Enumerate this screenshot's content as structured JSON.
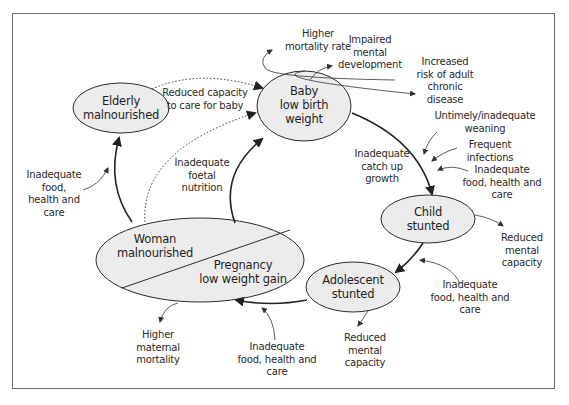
{
  "diagram": {
    "type": "cycle",
    "nodes": {
      "elderly": {
        "line1": "Elderly",
        "line2": "malnourished"
      },
      "baby": {
        "line1": "Baby",
        "line2": "low birth",
        "line3": "weight"
      },
      "child": {
        "line1": "Child",
        "line2": "stunted"
      },
      "adolescent": {
        "line1": "Adolescent",
        "line2": "stunted"
      },
      "woman": {
        "line1": "Woman",
        "line2": "malnourished"
      },
      "pregnancy": {
        "line1": "Pregnancy",
        "line2": "low weight gain"
      }
    },
    "labels": {
      "reduced_capacity": {
        "line1": "Reduced capacity",
        "line2": "to care for baby"
      },
      "higher_mortality": {
        "line1": "Higher",
        "line2": "mortality rate"
      },
      "impaired_mental": {
        "line1": "Impaired",
        "line2": "mental",
        "line3": "development"
      },
      "increased_risk": {
        "line1": "Increased",
        "line2": "risk of adult",
        "line3": "chronic",
        "line4": "disease"
      },
      "untimely_weaning": {
        "line1": "Untimely/inadequate",
        "line2": "weaning"
      },
      "frequent_infections": {
        "line1": "Frequent",
        "line2": "infections"
      },
      "inadequate_child": {
        "line1": "Inadequate",
        "line2": "food, health and",
        "line3": "care"
      },
      "catch_up": {
        "line1": "Inadequate",
        "line2": "catch up",
        "line3": "growth"
      },
      "foetal": {
        "line1": "Inadequate",
        "line2": "foetal",
        "line3": "nutrition"
      },
      "inadequate_elderly": {
        "line1": "Inadequate",
        "line2": "food,",
        "line3": "health and",
        "line4": "care"
      },
      "child_mental": {
        "line1": "Reduced",
        "line2": "mental",
        "line3": "capacity"
      },
      "inadequate_adolescent": {
        "line1": "Inadequate",
        "line2": "food, health and",
        "line3": "care"
      },
      "adolescent_mental": {
        "line1": "Reduced",
        "line2": "mental",
        "line3": "capacity"
      },
      "inadequate_woman": {
        "line1": "Inadequate",
        "line2": "food, health and",
        "line3": "care"
      },
      "maternal_mortality": {
        "line1": "Higher",
        "line2": "maternal",
        "line3": "mortality"
      }
    },
    "colors": {
      "node_fill": "#ececec",
      "stroke": "#2b2b2b",
      "frame": "#6b6b6b"
    }
  }
}
